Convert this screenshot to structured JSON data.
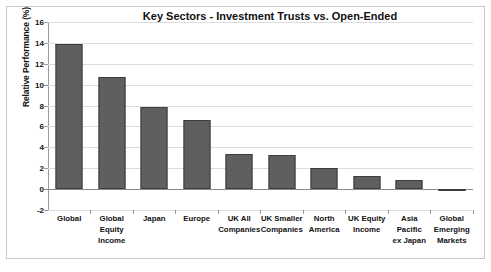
{
  "chart_data": {
    "type": "bar",
    "title": "Key Sectors - Investment Trusts vs. Open-Ended",
    "subtitle": "Relative performance over 12 months to 31 August 2017",
    "xlabel": "",
    "ylabel": "Relative Performance (%)",
    "ylim": [
      -2,
      16
    ],
    "ytick_step": 2,
    "yticks": [
      16,
      14,
      12,
      10,
      8,
      6,
      4,
      2,
      0,
      -2
    ],
    "grid": true,
    "legend": "none",
    "bar_color": "#5f5f5f",
    "bar_edge_color": "#3d3d3d",
    "categories": [
      "Global",
      "Global Equity Income",
      "Japan",
      "Europe",
      "UK All Companies",
      "UK Smaller Companies",
      "North America",
      "UK Equity Income",
      "Asia Pacific ex Japan",
      "Global Emerging Markets"
    ],
    "category_label_lines": [
      [
        "Global"
      ],
      [
        "Global",
        "Equity",
        "Income"
      ],
      [
        "Japan"
      ],
      [
        "Europe"
      ],
      [
        "UK All",
        "Companies"
      ],
      [
        "UK Smaller",
        "Companies"
      ],
      [
        "North",
        "America"
      ],
      [
        "UK Equity",
        "Income"
      ],
      [
        "Asia Pacific",
        "ex Japan"
      ],
      [
        "Global",
        "Emerging",
        "Markets"
      ]
    ],
    "values": [
      13.9,
      10.7,
      7.9,
      6.6,
      3.4,
      3.3,
      2.0,
      1.3,
      0.9,
      -0.15
    ]
  }
}
